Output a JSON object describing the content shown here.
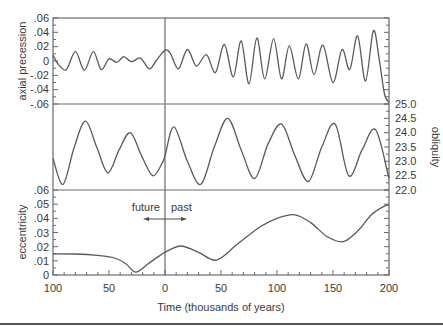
{
  "chart_data": [
    {
      "type": "line",
      "panel": "top",
      "ylabel": "axial precession",
      "ylim": [
        -0.06,
        0.06
      ],
      "yticks": [
        ".06",
        ".04",
        ".02",
        "0",
        "-.02",
        "-.04",
        "-.06"
      ],
      "x": [
        -100,
        -95,
        -88,
        -80,
        -72,
        -64,
        -57,
        -50,
        -43,
        -37,
        -30,
        -22,
        -14,
        -8,
        0,
        5,
        12,
        20,
        28,
        37,
        45,
        53,
        61,
        68,
        75,
        82,
        89,
        97,
        104,
        111,
        119,
        126,
        133,
        141,
        150,
        158,
        165,
        172,
        179,
        186,
        191,
        196,
        200
      ],
      "values": [
        0.008,
        -0.005,
        -0.012,
        0.013,
        -0.013,
        0.013,
        -0.012,
        0.003,
        -0.002,
        0.006,
        -0.001,
        0.004,
        -0.011,
        0.0,
        0.015,
        0.01,
        -0.011,
        0.016,
        -0.007,
        0.009,
        -0.016,
        0.023,
        -0.022,
        0.028,
        -0.032,
        0.032,
        -0.025,
        0.031,
        -0.025,
        0.021,
        -0.025,
        0.024,
        -0.019,
        0.022,
        -0.03,
        0.016,
        -0.012,
        0.035,
        -0.028,
        0.042,
        0.005,
        -0.046,
        -0.058
      ]
    },
    {
      "type": "line",
      "panel": "middle",
      "ylabel": "obliquity",
      "ylim": [
        22.0,
        25.0
      ],
      "yticks": [
        "25.0",
        "24.5",
        "24.0",
        "23.5",
        "23.0",
        "22.5",
        "22.0"
      ],
      "x": [
        -100,
        -91,
        -81,
        -71,
        -61,
        -51,
        -41,
        -31,
        -21,
        -11,
        -3,
        0,
        8,
        20,
        32,
        44,
        56,
        68,
        80,
        92,
        104,
        116,
        128,
        140,
        152,
        164,
        176,
        188,
        200
      ],
      "values": [
        23.1,
        22.2,
        23.5,
        24.4,
        23.5,
        22.6,
        23.4,
        24.0,
        23.2,
        22.5,
        22.9,
        23.2,
        24.2,
        23.0,
        22.2,
        23.5,
        24.5,
        23.4,
        22.4,
        23.6,
        24.3,
        23.2,
        22.3,
        23.5,
        24.3,
        22.5,
        23.4,
        24.1,
        22.4
      ]
    },
    {
      "type": "line",
      "panel": "bottom",
      "ylabel": "eccentricity",
      "ylim": [
        0,
        0.06
      ],
      "yticks": [
        ".06",
        ".05",
        ".04",
        ".03",
        ".02",
        ".01",
        "0"
      ],
      "x": [
        -100,
        -80,
        -60,
        -45,
        -35,
        -26,
        -15,
        -5,
        0,
        14,
        30,
        46,
        65,
        85,
        100,
        116,
        130,
        145,
        159,
        172,
        185,
        197,
        200
      ],
      "values": [
        0.015,
        0.0148,
        0.0138,
        0.012,
        0.008,
        0.002,
        0.008,
        0.0135,
        0.016,
        0.0205,
        0.016,
        0.0105,
        0.022,
        0.034,
        0.04,
        0.0425,
        0.037,
        0.027,
        0.0235,
        0.031,
        0.043,
        0.049,
        0.049
      ]
    }
  ],
  "x_axis": {
    "title": "Time (thousands of years)",
    "ticks": [
      "100",
      "50",
      "0",
      "50",
      "100",
      "150",
      "200"
    ],
    "tick_values": [
      -100,
      -50,
      0,
      50,
      100,
      150,
      200
    ],
    "xlim": [
      -100,
      200
    ]
  },
  "annotations": {
    "future_label": "future",
    "past_label": "past"
  },
  "labels": {
    "precession": "axial precession",
    "obliquity": "obliquity",
    "eccentricity": "eccentricity"
  }
}
